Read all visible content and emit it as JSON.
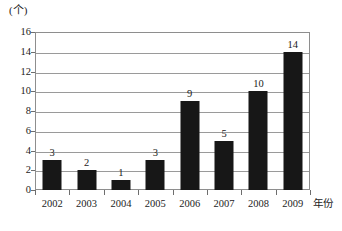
{
  "chart_data": {
    "type": "bar",
    "title": "",
    "subtitle": "",
    "xlabel": "年份",
    "ylabel": "(个)",
    "categories": [
      "2002",
      "2003",
      "2004",
      "2005",
      "2006",
      "2007",
      "2008",
      "2009"
    ],
    "values": [
      3,
      2,
      1,
      3,
      9,
      5,
      10,
      14
    ],
    "data_labels": [
      "3",
      "2",
      "1",
      "3",
      "9",
      "5",
      "10",
      "14"
    ],
    "ylim": [
      0,
      16
    ],
    "ytick_labels": [
      "16",
      "14",
      "12",
      "10",
      "8",
      "6",
      "4",
      "2",
      "0"
    ],
    "ytick_values": [
      16,
      14,
      12,
      10,
      8,
      6,
      4,
      2,
      0
    ],
    "ytick_step": 2,
    "grid": true,
    "grid_axis": "y",
    "legend": false,
    "legend_position": "none",
    "bar_color": "#171717",
    "grid_color": "#9a9a9a",
    "frame_color": "#8e8e8e",
    "text_color": "#1c1c1c",
    "background_color": "#ffffff"
  }
}
